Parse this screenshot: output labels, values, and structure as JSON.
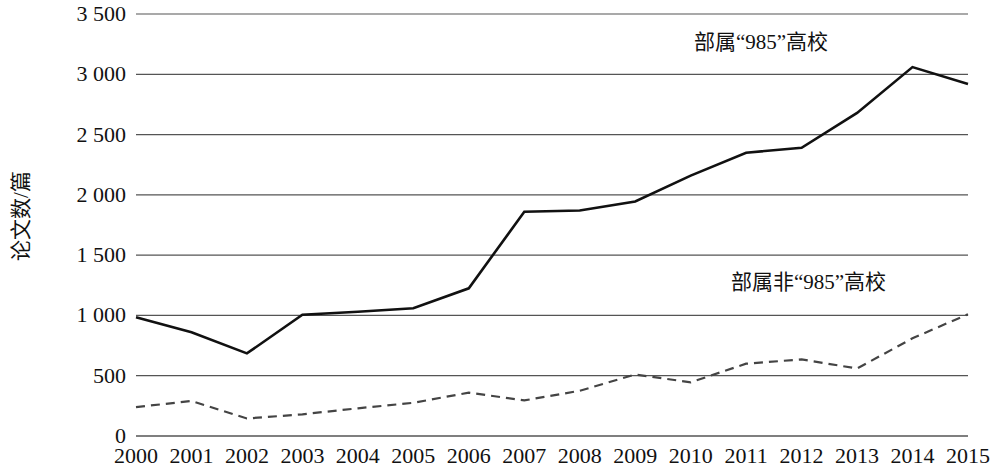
{
  "chart_data": {
    "type": "line",
    "title": "",
    "xlabel": "",
    "ylabel": "论文数/篇",
    "x": [
      2000,
      2001,
      2002,
      2003,
      2004,
      2005,
      2006,
      2007,
      2008,
      2009,
      2010,
      2011,
      2012,
      2013,
      2014,
      2015
    ],
    "categories": [
      "2000",
      "2001",
      "2002",
      "2003",
      "2004",
      "2005",
      "2006",
      "2007",
      "2008",
      "2009",
      "2010",
      "2011",
      "2012",
      "2013",
      "2014",
      "2015"
    ],
    "xlim": [
      2000,
      2015
    ],
    "ylim": [
      0,
      3500
    ],
    "yticks": [
      0,
      500,
      1000,
      1500,
      2000,
      2500,
      3000,
      3500
    ],
    "ytick_labels": [
      "0",
      "500",
      "1 000",
      "1 500",
      "2 000",
      "2 500",
      "3 000",
      "3 500"
    ],
    "grid": "horizontal",
    "legend_position": "inline-annotation",
    "series": [
      {
        "name": "部属“985”高校",
        "style": "solid",
        "color": "#111111",
        "values": [
          985,
          860,
          685,
          1005,
          1030,
          1060,
          1225,
          1860,
          1870,
          1945,
          2160,
          2350,
          2390,
          2680,
          3060,
          2920
        ]
      },
      {
        "name": "部属非“985”高校",
        "style": "dashed",
        "color": "#444444",
        "values": [
          240,
          290,
          145,
          180,
          230,
          275,
          360,
          295,
          375,
          510,
          445,
          600,
          635,
          560,
          810,
          1010
        ]
      }
    ],
    "annotations": [
      {
        "text": "部属“985”高校",
        "x": 2013,
        "y": 3300
      },
      {
        "text": "部属非“985”高校",
        "x": 2014,
        "y": 1350
      }
    ]
  }
}
